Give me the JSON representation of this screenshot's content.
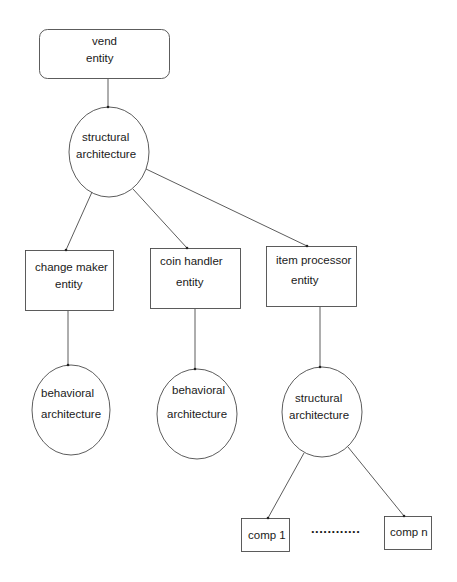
{
  "diagram": {
    "title": "",
    "nodes": {
      "vend_entity": {
        "shape": "rounded-rect",
        "lines": [
          "vend",
          "entity"
        ]
      },
      "structural_architecture_top": {
        "shape": "ellipse",
        "lines": [
          "structural",
          "architecture"
        ]
      },
      "change_maker_entity": {
        "shape": "rect",
        "lines": [
          "change maker",
          "entity"
        ]
      },
      "coin_handler_entity": {
        "shape": "rect",
        "lines": [
          "coin handler",
          "entity"
        ]
      },
      "item_processor_entity": {
        "shape": "rect",
        "lines": [
          "item processor",
          "entity"
        ]
      },
      "behavioral_architecture_1": {
        "shape": "ellipse",
        "lines": [
          "behavioral",
          "architecture"
        ]
      },
      "behavioral_architecture_2": {
        "shape": "ellipse",
        "lines": [
          "behavioral",
          "architecture"
        ]
      },
      "structural_architecture_bottom": {
        "shape": "ellipse",
        "lines": [
          "structural",
          "architecture"
        ]
      },
      "comp_1": {
        "shape": "rect",
        "lines": [
          "comp 1"
        ]
      },
      "comp_n": {
        "shape": "rect",
        "lines": [
          "comp n"
        ]
      }
    },
    "ellipsis": "............",
    "edges": [
      [
        "vend_entity",
        "structural_architecture_top"
      ],
      [
        "structural_architecture_top",
        "change_maker_entity"
      ],
      [
        "structural_architecture_top",
        "coin_handler_entity"
      ],
      [
        "structural_architecture_top",
        "item_processor_entity"
      ],
      [
        "change_maker_entity",
        "behavioral_architecture_1"
      ],
      [
        "coin_handler_entity",
        "behavioral_architecture_2"
      ],
      [
        "item_processor_entity",
        "structural_architecture_bottom"
      ],
      [
        "structural_architecture_bottom",
        "comp_1"
      ],
      [
        "structural_architecture_bottom",
        "comp_n"
      ]
    ],
    "colors": {
      "stroke": "#4a4a4a",
      "text": "#1a1a1a",
      "background": "#ffffff"
    }
  }
}
